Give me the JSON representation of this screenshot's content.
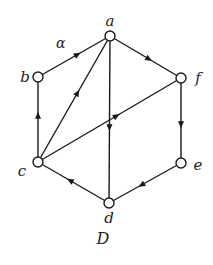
{
  "diagram": {
    "title": "D",
    "edge_label": "α",
    "nodes": [
      {
        "id": "a",
        "label": "a"
      },
      {
        "id": "b",
        "label": "b"
      },
      {
        "id": "c",
        "label": "c"
      },
      {
        "id": "d",
        "label": "d"
      },
      {
        "id": "e",
        "label": "e"
      },
      {
        "id": "f",
        "label": "f"
      }
    ],
    "edges": [
      {
        "from": "b",
        "to": "a",
        "label": "α"
      },
      {
        "from": "a",
        "to": "f"
      },
      {
        "from": "c",
        "to": "a"
      },
      {
        "from": "c",
        "to": "f"
      },
      {
        "from": "c",
        "to": "b"
      },
      {
        "from": "f",
        "to": "e"
      },
      {
        "from": "a",
        "to": "d"
      },
      {
        "from": "d",
        "to": "c"
      },
      {
        "from": "e",
        "to": "d"
      }
    ],
    "colors": {
      "stroke": "#1a1a1a",
      "node_fill": "#ffffff"
    }
  }
}
